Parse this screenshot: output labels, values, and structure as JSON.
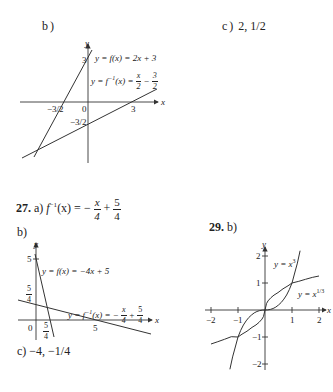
{
  "problem_26": {
    "part_b_label": "b)",
    "part_c_label": "c)",
    "part_c_answer": "2, 1/2",
    "graph": {
      "axis_x_label": "x",
      "axis_y_label": "y",
      "line1_label": "y = f(x) = 2x + 3",
      "line2_label_prefix": "y = f",
      "line2_label_sup": "−1",
      "line2_label_mid": "(x) = ",
      "line2_frac1_num": "x",
      "line2_frac1_den": "2",
      "line2_op": "−",
      "line2_frac2_num": "3",
      "line2_frac2_den": "2",
      "tick_y_top": "3",
      "tick_x_neg": "−3/2",
      "tick_origin": "0",
      "tick_x_pos": "3",
      "tick_y_neg": "−3/2"
    }
  },
  "problem_27": {
    "number": "27.",
    "part_a_label": "a)",
    "part_a_lhs": "f",
    "part_a_sup": "−1",
    "part_a_mid": "(x) = −",
    "part_a_frac1_num": "x",
    "part_a_frac1_den": "4",
    "part_a_op": "+",
    "part_a_frac2_num": "5",
    "part_a_frac2_den": "4",
    "part_b_label": "b)",
    "part_c_label": "c)",
    "part_c_answer": "−4, −1/4",
    "graph": {
      "axis_x_label": "x",
      "axis_y_label": "y",
      "line1_label": "y = f(x) = −4x + 5",
      "line2_label_prefix": "y = f",
      "line2_label_sup": "−1",
      "line2_label_mid": "(x) = −",
      "line2_frac1_num": "x",
      "line2_frac1_den": "4",
      "line2_op": "+",
      "line2_frac2_num": "5",
      "line2_frac2_den": "4",
      "tick_y_top": "5",
      "tick_y_frac_num": "5",
      "tick_y_frac_den": "4",
      "tick_origin": "0",
      "tick_x_frac_num": "5",
      "tick_x_frac_den": "4",
      "tick_x_pos": "5"
    }
  },
  "problem_29": {
    "number": "29.",
    "part_b_label": "b)",
    "graph": {
      "axis_x_label": "x",
      "axis_y_label": "y",
      "curve1_label": "y = x",
      "curve1_sup": "3",
      "curve2_label": "y = x",
      "curve2_sup": "1/3",
      "ticks_x": [
        "−2",
        "−1",
        "1",
        "2"
      ],
      "ticks_y": [
        "2",
        "1",
        "−1",
        "−2"
      ]
    }
  }
}
